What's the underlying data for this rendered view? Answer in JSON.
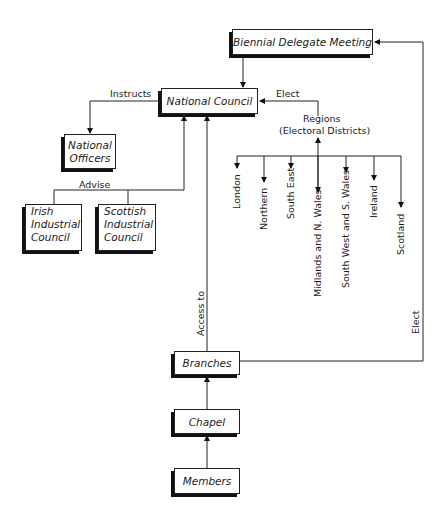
{
  "diagram": {
    "nodes": {
      "biennial": "Biennial Delegate Meeting",
      "national_council": "National Council",
      "national_officers_line1": "National",
      "national_officers_line2": "Officers",
      "irish_line1": "Irish",
      "irish_line2": "Industrial",
      "irish_line3": "Council",
      "scottish_line1": "Scottish",
      "scottish_line2": "Industrial",
      "scottish_line3": "Council",
      "branches": "Branches",
      "chapel": "Chapel",
      "members": "Members"
    },
    "labels": {
      "instructs": "Instructs",
      "elect_regions": "Elect",
      "regions_line1": "Regions",
      "regions_line2": "(Electoral Districts)",
      "advise": "Advise",
      "access_to": "Access to",
      "elect_branches": "Elect"
    },
    "regions": [
      "London",
      "Northern",
      "South East",
      "Midlands and N. Wales",
      "South West and S. Wales",
      "Ireland",
      "Scotland"
    ]
  }
}
